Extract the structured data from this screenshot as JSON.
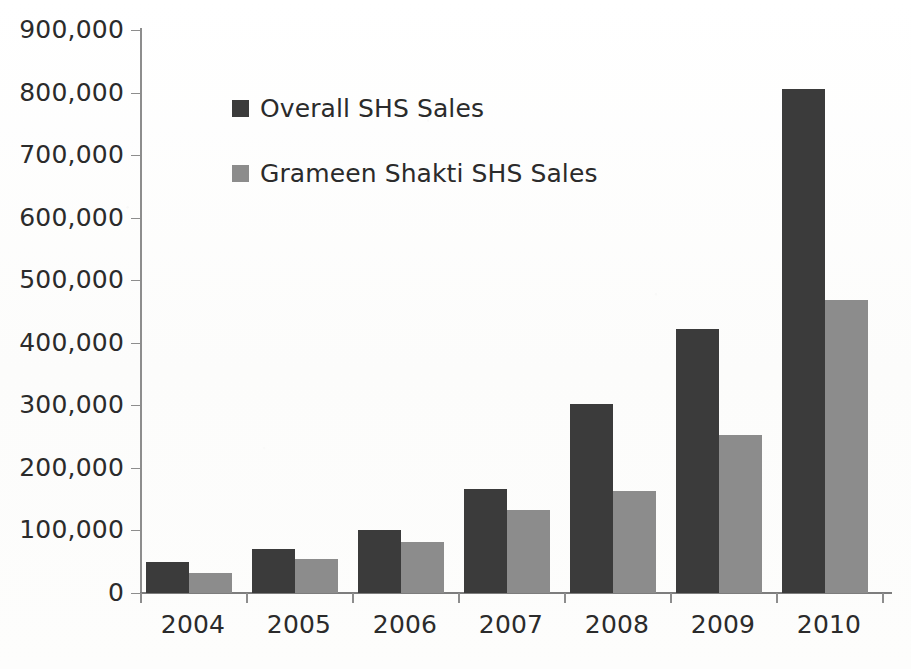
{
  "chart_data": {
    "type": "bar",
    "title": "",
    "subtitle": "",
    "xlabel": "",
    "ylabel": "",
    "categories": [
      "2004",
      "2005",
      "2006",
      "2007",
      "2008",
      "2009",
      "2010"
    ],
    "series": [
      {
        "name": "Overall SHS Sales",
        "color": "#3b3b3b",
        "values": [
          50000,
          70000,
          101000,
          167000,
          302000,
          422000,
          805000
        ]
      },
      {
        "name": "Grameen Shakti SHS Sales",
        "color": "#8c8c8c",
        "values": [
          32000,
          55000,
          81000,
          132000,
          163000,
          253000,
          469000
        ]
      }
    ],
    "ylim": [
      0,
      900000
    ],
    "ytick_step": 100000,
    "ytick_labels": [
      "0",
      "100,000",
      "200,000",
      "300,000",
      "400,000",
      "500,000",
      "600,000",
      "700,000",
      "800,000",
      "900,000"
    ],
    "grid": false,
    "legend_position": "inside-upper-left",
    "annotations": []
  },
  "legend": {
    "items": [
      {
        "label": "Overall SHS Sales",
        "marker": "legend-swatch-dark"
      },
      {
        "label": "Grameen Shakti SHS Sales",
        "marker": "legend-swatch-gray"
      }
    ]
  }
}
